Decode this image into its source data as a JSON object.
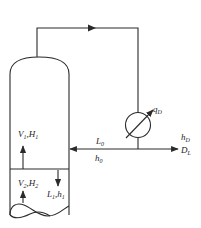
{
  "diagram": {
    "type": "distillation column top section with total condenser",
    "labels": {
      "vapor_up": {
        "main": "V",
        "sub": "1",
        "sep": ",",
        "main2": "H",
        "sub2": "1"
      },
      "vapor_in": {
        "main": "V",
        "sub": "2",
        "sep": ",",
        "main2": "H",
        "sub2": "2"
      },
      "liquid_down": {
        "main": "L",
        "sub": "1",
        "sep": ",",
        "main2": "h",
        "sub2": "1"
      },
      "reflux": {
        "main": "L",
        "sub": "0"
      },
      "reflux_enthalpy": {
        "main": "h",
        "sub": "0"
      },
      "condenser_duty": {
        "main": "q",
        "sub": "D"
      },
      "distillate_enthalpy": {
        "main": "h",
        "sub": "D"
      },
      "distillate": {
        "main": "D",
        "sub": "L"
      }
    },
    "components": [
      "column",
      "tray",
      "condenser",
      "vapor-line",
      "reflux-line",
      "distillate-line"
    ]
  }
}
